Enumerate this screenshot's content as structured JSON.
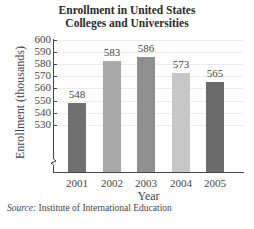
{
  "chart_data": {
    "type": "bar",
    "title_lines": [
      "",
      "Enrollment in United States",
      "Colleges and Universities"
    ],
    "categories": [
      "2001",
      "2002",
      "2003",
      "2004",
      "2005"
    ],
    "values": [
      548,
      583,
      586,
      573,
      565
    ],
    "value_labels": [
      "548",
      "583",
      "586",
      "573",
      "565"
    ],
    "bar_colors": [
      "#707070",
      "#a9a9a9",
      "#8f8f8f",
      "#c6c6c6",
      "#6b6b6b"
    ],
    "xlabel": "Year",
    "ylabel": "Enrollment (thousands)",
    "ylim": [
      520,
      600
    ],
    "yticks": [
      "600",
      "590",
      "580",
      "570",
      "560",
      "550",
      "540",
      "530"
    ],
    "axis_break": true,
    "grid": true,
    "legend": null
  },
  "source": {
    "label": "Source:",
    "text": " Institute of International Education"
  }
}
